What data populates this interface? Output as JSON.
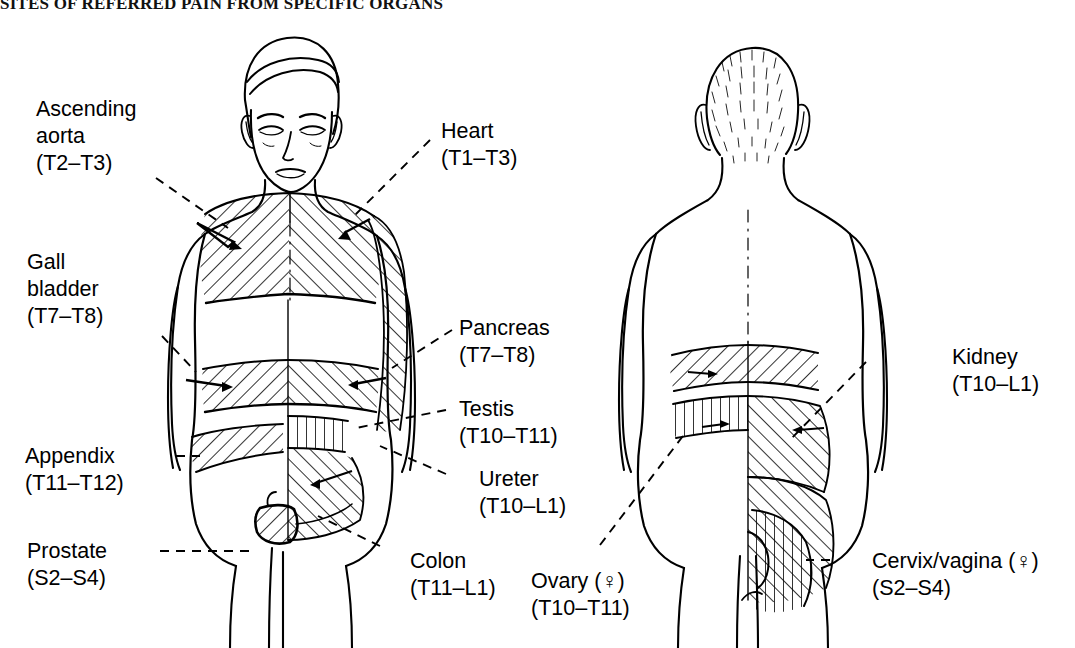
{
  "title": "SITES OF REFERRED PAIN FROM SPECIFIC ORGANS",
  "figure": {
    "type": "anatomical-diagram",
    "views": [
      {
        "name": "anterior",
        "description": "Front view of male torso with hatched referred-pain dermatome regions"
      },
      {
        "name": "posterior",
        "description": "Back view of torso with hatched referred-pain dermatome regions"
      }
    ],
    "hatch_meaning": "Diagonally hatched areas indicate skin regions where pain from the named organ is referred"
  },
  "labels": {
    "ascending_aorta": {
      "organ": "Ascending",
      "organ2": "aorta",
      "segments": "(T2–T3)",
      "side": "anterior-left"
    },
    "gall_bladder": {
      "organ": "Gall",
      "organ2": "bladder",
      "segments": "(T7–T8)",
      "side": "anterior-left"
    },
    "appendix": {
      "organ": "Appendix",
      "segments": "(T11–T12)",
      "side": "anterior-left"
    },
    "prostate": {
      "organ": "Prostate",
      "segments": "(S2–S4)",
      "side": "anterior-left"
    },
    "heart": {
      "organ": "Heart",
      "segments": "(T1–T3)",
      "side": "anterior-right"
    },
    "pancreas": {
      "organ": "Pancreas",
      "segments": "(T7–T8)",
      "side": "anterior-right"
    },
    "testis": {
      "organ": "Testis",
      "segments": "(T10–T11)",
      "side": "anterior-right"
    },
    "ureter": {
      "organ": "Ureter",
      "segments": "(T10–L1)",
      "side": "anterior-right"
    },
    "colon": {
      "organ": "Colon",
      "segments": "(T11–L1)",
      "side": "anterior-right"
    },
    "ovary": {
      "organ": "Ovary (♀)",
      "segments": "(T10–T11)",
      "side": "posterior-left"
    },
    "kidney": {
      "organ": "Kidney",
      "segments": "(T10–L1)",
      "side": "posterior-right"
    },
    "cervix_vagina": {
      "organ": "Cervix/vagina (♀)",
      "segments": "(S2–S4)",
      "side": "posterior-right"
    }
  },
  "colors": {
    "ink": "#000000",
    "background": "#ffffff",
    "hatch": "#000000"
  }
}
